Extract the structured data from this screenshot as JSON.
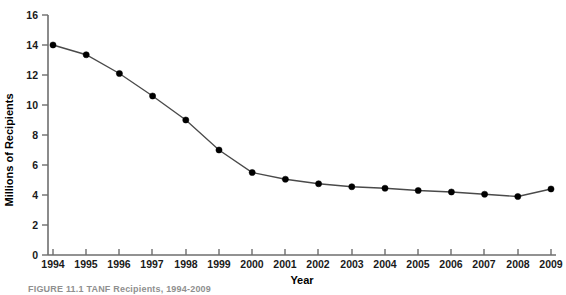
{
  "chart_data": {
    "type": "line",
    "title": "",
    "xlabel": "Year",
    "ylabel": "Millions of Recipients",
    "categories": [
      "1994",
      "1995",
      "1996",
      "1997",
      "1998",
      "1999",
      "2000",
      "2001",
      "2002",
      "2003",
      "2004",
      "2005",
      "2006",
      "2007",
      "2008",
      "2009"
    ],
    "x": [
      1994,
      1995,
      1996,
      1997,
      1998,
      1999,
      2000,
      2001,
      2002,
      2003,
      2004,
      2005,
      2006,
      2007,
      2008,
      2009
    ],
    "values": [
      14.0,
      13.35,
      12.1,
      10.6,
      9.0,
      7.0,
      5.5,
      5.05,
      4.75,
      4.55,
      4.45,
      4.3,
      4.2,
      4.05,
      3.9,
      4.4
    ],
    "series": [
      {
        "name": "Millions of Recipients",
        "values": [
          14.0,
          13.35,
          12.1,
          10.6,
          9.0,
          7.0,
          5.5,
          5.05,
          4.75,
          4.55,
          4.45,
          4.3,
          4.2,
          4.05,
          3.9,
          4.4
        ]
      }
    ],
    "ylim": [
      0,
      16
    ],
    "yticks": [
      0,
      2,
      4,
      6,
      8,
      10,
      12,
      14,
      16
    ],
    "ytick_labels": [
      "0",
      "2",
      "4",
      "6",
      "8",
      "10",
      "12",
      "14",
      "16"
    ],
    "xtick_labels": [
      "1994",
      "1995",
      "1996",
      "1997",
      "1998",
      "1999",
      "2000",
      "2001",
      "2002",
      "2003",
      "2004",
      "2005",
      "2006",
      "2007",
      "2008",
      "2009"
    ],
    "grid": false,
    "legend": false,
    "marker": "filled-circle",
    "line_color": "#4a4a4a",
    "marker_color": "#000000",
    "axis_color": "#6e6e6e"
  },
  "figure": {
    "caption": "FIGURE 11.1   TANF Recipients, 1994-2009"
  }
}
